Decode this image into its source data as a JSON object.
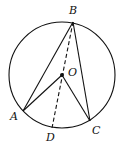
{
  "diagram": {
    "type": "geometry-circle-inscribed-angles",
    "circle": {
      "center": "O",
      "cx": 62,
      "cy": 75,
      "r": 53
    },
    "points": {
      "A": {
        "x": 23,
        "y": 111,
        "label": "A"
      },
      "B": {
        "x": 73,
        "y": 22,
        "label": "B"
      },
      "C": {
        "x": 90,
        "y": 121,
        "label": "C"
      },
      "D": {
        "x": 52,
        "y": 128,
        "label": "D"
      },
      "O": {
        "x": 62,
        "y": 75,
        "label": "O"
      }
    },
    "segments": [
      {
        "from": "B",
        "to": "A",
        "style": "solid"
      },
      {
        "from": "B",
        "to": "C",
        "style": "solid"
      },
      {
        "from": "O",
        "to": "A",
        "style": "solid"
      },
      {
        "from": "O",
        "to": "C",
        "style": "solid"
      },
      {
        "from": "B",
        "to": "D",
        "style": "dashed"
      }
    ],
    "labels": {
      "A": "A",
      "B": "B",
      "C": "C",
      "D": "D",
      "O": "O"
    }
  }
}
